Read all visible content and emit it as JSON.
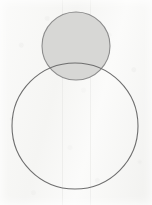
{
  "figure": {
    "kind": "geometry-diagram",
    "medium": "scanned-paper",
    "canvas": {
      "width": 152,
      "height": 205
    },
    "background": {
      "name": "scanned-paper-background",
      "color": "#f5f5f3",
      "highlight_color": "#fbfbfa",
      "shadow_color": "#f1f1ef"
    },
    "shapes": [
      {
        "id": "small-circle",
        "name": "small-shaded-circle",
        "type": "circle",
        "cx": 76,
        "cy": 46,
        "r": 34,
        "fill": "#d7d7d5",
        "stroke": "#8c8c8c",
        "stroke_width": 1.1,
        "filled": true,
        "label": ""
      },
      {
        "id": "large-circle",
        "name": "large-unfilled-circle",
        "type": "circle",
        "cx": 75,
        "cy": 126,
        "r": 63,
        "fill": "none",
        "stroke": "#6e6e6e",
        "stroke_width": 1.1,
        "filled": false,
        "label": ""
      }
    ],
    "tangency": {
      "name": "tangent-point",
      "x": 76,
      "y": 79,
      "relation": "external",
      "visible_marker": false
    },
    "artifacts": {
      "name": "scan-artifacts",
      "vertical_lines": [
        {
          "x": 62,
          "color": "#e6e6e4",
          "width": 1
        },
        {
          "x": 90,
          "color": "#e8e8e6",
          "width": 1
        }
      ],
      "grain_color": "#787878"
    },
    "annotations": [],
    "labels": []
  }
}
